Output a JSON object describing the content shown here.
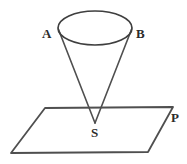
{
  "figure": {
    "background_color": "#ffffff",
    "stroke_color": "#4f4f4f",
    "label_color": "#2b2b2b",
    "width": 187,
    "height": 164
  },
  "labels": {
    "apex": "S",
    "rim_left": "A",
    "rim_right": "B",
    "plane": "P"
  },
  "shapes": {
    "cone": {
      "name": "cone",
      "rim_ellipse": {
        "center_x": 95,
        "center_y": 28,
        "radius_x": 37,
        "radius_y": 17
      },
      "apex_x": 95,
      "apex_y": 123,
      "slant_left_from": [
        58,
        29
      ],
      "slant_right_from": [
        132,
        29
      ]
    },
    "plane": {
      "name": "plane-parallelogram",
      "points": [
        [
          45,
          108
        ],
        [
          173,
          107
        ],
        [
          148,
          152
        ],
        [
          11,
          153
        ]
      ]
    }
  }
}
